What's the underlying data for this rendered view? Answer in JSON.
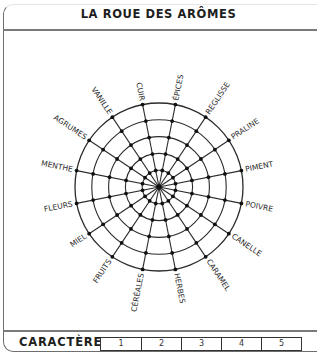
{
  "header": {
    "title": "LA ROUE DES ARÔMES"
  },
  "wheel": {
    "center": [
      159,
      157
    ],
    "radius": 84,
    "rings": 5,
    "colors": {
      "line": "#2b2b2b",
      "dot": "#111111"
    },
    "aromas": [
      "ÉPICES",
      "REGLISSE",
      "PRALINE",
      "PIMENT",
      "POIVRE",
      "CANELLE",
      "CARAMEL",
      "HERBES",
      "CÉRÉALES",
      "FRUITS",
      "MIEL",
      "FLEURS",
      "MENTHE",
      "AGRUMES",
      "VANILLE",
      "CUIR"
    ]
  },
  "footer": {
    "label": "CARACTÈRE",
    "scale": [
      "1",
      "2",
      "3",
      "4",
      "5"
    ]
  }
}
